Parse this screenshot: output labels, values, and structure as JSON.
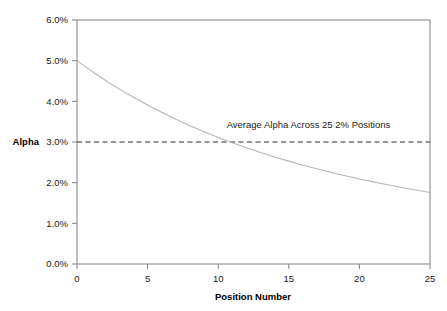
{
  "chart_data": {
    "type": "line",
    "title": "",
    "xlabel": "Position Number",
    "ylabel": "Alpha",
    "xlim": [
      0,
      25
    ],
    "ylim": [
      0,
      0.06
    ],
    "grid": false,
    "legend_position": "none",
    "x_tick_labels": [
      "0",
      "5",
      "10",
      "15",
      "20",
      "25"
    ],
    "x_ticks": [
      0,
      5,
      10,
      15,
      20,
      25
    ],
    "y_tick_labels": [
      "0.0%",
      "1.0%",
      "2.0%",
      "3.0%",
      "4.0%",
      "5.0%",
      "6.0%"
    ],
    "y_ticks": [
      0.0,
      0.01,
      0.02,
      0.03,
      0.04,
      0.05,
      0.06
    ],
    "series": [
      {
        "name": "Alpha",
        "style": "solid",
        "color": "#b5b5b5",
        "x": [
          0,
          1,
          2,
          3,
          4,
          5,
          6,
          7,
          8,
          9,
          10,
          11,
          12,
          13,
          14,
          15,
          16,
          17,
          18,
          19,
          20,
          21,
          22,
          23,
          24,
          25
        ],
        "values": [
          0.05,
          0.0475,
          0.0452,
          0.043,
          0.041,
          0.0391,
          0.0373,
          0.0356,
          0.034,
          0.0325,
          0.0311,
          0.0298,
          0.0286,
          0.0274,
          0.0263,
          0.0253,
          0.0243,
          0.0234,
          0.0225,
          0.0217,
          0.0209,
          0.0202,
          0.0195,
          0.0188,
          0.0182,
          0.0176
        ]
      },
      {
        "name": "Average Alpha Across 25 2% Positions",
        "style": "dashed",
        "color": "#2b2b2b",
        "x": [
          0,
          25
        ],
        "values": [
          0.03,
          0.03
        ]
      }
    ],
    "annotations": [
      {
        "text": "Average Alpha Across 25 2% Positions",
        "x": 10.6,
        "y": 0.0335
      }
    ]
  }
}
